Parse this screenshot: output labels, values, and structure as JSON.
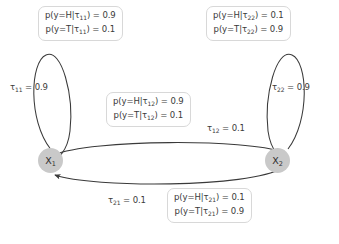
{
  "diagram": {
    "background_color": "#ffffff",
    "node_color": "#c9c9c9",
    "stroke_color": "#3a3a3a",
    "box_border_color": "#d8d8d8"
  },
  "nodes": [
    {
      "id": "x1",
      "symbol": "X",
      "subscript": "1"
    },
    {
      "id": "x2",
      "symbol": "X",
      "subscript": "2"
    }
  ],
  "transition_labels": [
    {
      "id": "tau11",
      "symbol": "τ",
      "subscript": "11",
      "equals": " = ",
      "value": "0.9"
    },
    {
      "id": "tau22",
      "symbol": "τ",
      "subscript": "22",
      "equals": " = ",
      "value": "0.9"
    },
    {
      "id": "tau12",
      "symbol": "τ",
      "subscript": "12",
      "equals": " = ",
      "value": "0.1"
    },
    {
      "id": "tau21",
      "symbol": "τ",
      "subscript": "21",
      "equals": " = ",
      "value": "0.1"
    }
  ],
  "emission_boxes": [
    {
      "id": "tau11",
      "lines": [
        {
          "prefix": "p(y=H|τ",
          "subscript": "11",
          "suffix": ") = 0.9"
        },
        {
          "prefix": "p(y=T|τ",
          "subscript": "11",
          "suffix": ") = 0.1"
        }
      ]
    },
    {
      "id": "tau22",
      "lines": [
        {
          "prefix": "p(y=H|τ",
          "subscript": "22",
          "suffix": ") = 0.1"
        },
        {
          "prefix": "p(y=T|τ",
          "subscript": "22",
          "suffix": ") = 0.9"
        }
      ]
    },
    {
      "id": "tau12",
      "lines": [
        {
          "prefix": "p(y=H|τ",
          "subscript": "12",
          "suffix": ") = 0.9"
        },
        {
          "prefix": "p(y=T|τ",
          "subscript": "12",
          "suffix": ") = 0.1"
        }
      ]
    },
    {
      "id": "tau21",
      "lines": [
        {
          "prefix": "p(y=H|τ",
          "subscript": "21",
          "suffix": ") = 0.1"
        },
        {
          "prefix": "p(y=T|τ",
          "subscript": "21",
          "suffix": ") = 0.9"
        }
      ]
    }
  ]
}
